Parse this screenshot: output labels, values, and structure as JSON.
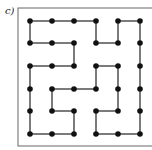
{
  "label": "c)",
  "grid": {
    "cols_x": [
      30,
      52,
      74,
      96,
      118,
      140
    ],
    "rows_y": [
      21,
      43,
      66,
      89,
      111,
      134
    ],
    "dot_radius": 2.8,
    "dot_color": "#111111",
    "line_color": "#333333"
  },
  "frame": {
    "x": 18,
    "y": 8,
    "width": 140,
    "height": 138,
    "color": "#666666"
  },
  "edges": [
    [
      [
        0,
        0
      ],
      [
        0,
        1
      ]
    ],
    [
      [
        0,
        1
      ],
      [
        0,
        2
      ]
    ],
    [
      [
        0,
        2
      ],
      [
        0,
        3
      ]
    ],
    [
      [
        0,
        4
      ],
      [
        0,
        5
      ]
    ],
    [
      [
        0,
        0
      ],
      [
        1,
        0
      ]
    ],
    [
      [
        0,
        3
      ],
      [
        1,
        3
      ]
    ],
    [
      [
        1,
        3
      ],
      [
        1,
        4
      ]
    ],
    [
      [
        0,
        4
      ],
      [
        1,
        4
      ]
    ],
    [
      [
        1,
        0
      ],
      [
        1,
        1
      ]
    ],
    [
      [
        1,
        1
      ],
      [
        1,
        2
      ]
    ],
    [
      [
        1,
        2
      ],
      [
        2,
        2
      ]
    ],
    [
      [
        2,
        0
      ],
      [
        2,
        1
      ]
    ],
    [
      [
        2,
        1
      ],
      [
        2,
        2
      ]
    ],
    [
      [
        2,
        0
      ],
      [
        3,
        0
      ]
    ],
    [
      [
        3,
        0
      ],
      [
        4,
        0
      ]
    ],
    [
      [
        4,
        0
      ],
      [
        5,
        0
      ]
    ],
    [
      [
        0,
        5
      ],
      [
        1,
        5
      ]
    ],
    [
      [
        1,
        5
      ],
      [
        2,
        5
      ]
    ],
    [
      [
        2,
        5
      ],
      [
        3,
        5
      ]
    ],
    [
      [
        3,
        5
      ],
      [
        4,
        5
      ]
    ],
    [
      [
        4,
        5
      ],
      [
        5,
        5
      ]
    ],
    [
      [
        2,
        3
      ],
      [
        2,
        4
      ]
    ],
    [
      [
        2,
        3
      ],
      [
        3,
        3
      ]
    ],
    [
      [
        2,
        4
      ],
      [
        3,
        4
      ]
    ],
    [
      [
        3,
        4
      ],
      [
        4,
        4
      ]
    ],
    [
      [
        3,
        1
      ],
      [
        3,
        2
      ]
    ],
    [
      [
        3,
        2
      ],
      [
        3,
        3
      ]
    ],
    [
      [
        3,
        1
      ],
      [
        4,
        1
      ]
    ],
    [
      [
        4,
        1
      ],
      [
        4,
        2
      ]
    ],
    [
      [
        4,
        2
      ],
      [
        5,
        2
      ]
    ],
    [
      [
        5,
        0
      ],
      [
        5,
        1
      ]
    ],
    [
      [
        5,
        1
      ],
      [
        5,
        2
      ]
    ],
    [
      [
        4,
        3
      ],
      [
        4,
        4
      ]
    ],
    [
      [
        4,
        3
      ],
      [
        5,
        3
      ]
    ],
    [
      [
        5,
        3
      ],
      [
        5,
        4
      ]
    ],
    [
      [
        5,
        4
      ],
      [
        5,
        5
      ]
    ]
  ]
}
